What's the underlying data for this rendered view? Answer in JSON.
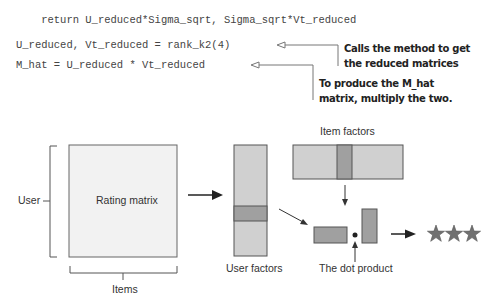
{
  "code": {
    "lines": [
      "    return U_reduced*Sigma_sqrt, Sigma_sqrt*Vt_reduced",
      "U_reduced, Vt_reduced = rank_k2(4)",
      "M_hat = U_reduced * Vt_reduced"
    ]
  },
  "annotations": [
    {
      "line1": "Calls the method to get",
      "line2": "the reduced matrices"
    },
    {
      "line1": "To produce the M_hat",
      "line2": "matrix, multiply the two."
    }
  ],
  "diagram": {
    "user_label": "User",
    "rating_matrix_label": "Rating matrix",
    "items_label": "Items",
    "user_factors_label": "User factors",
    "item_factors_label": "Item factors",
    "dot_product_label": "The dot product",
    "result_icon": "three-stars-icon",
    "colors": {
      "matrix_fill": "#f2f2f2",
      "factor_fill": "#d0d0d0",
      "factor_highlight": "#a0a0a0",
      "stroke": "#555555",
      "star": "#707070"
    }
  }
}
